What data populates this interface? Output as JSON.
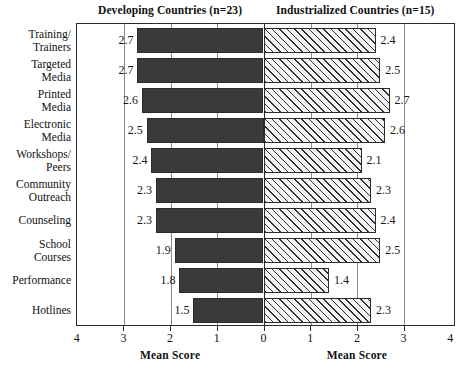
{
  "panels": {
    "left_title": "Developing Countries (n=23)",
    "right_title": "Industrialized Countries (n=15)"
  },
  "axis": {
    "left_axis_title": "Mean Score",
    "right_axis_title": "Mean Score",
    "ticks": [
      "4",
      "3",
      "2",
      "1",
      "0",
      "1",
      "2",
      "3",
      "4"
    ]
  },
  "chart_data": {
    "type": "bar",
    "orientation": "horizontal",
    "subtype": "diverging-pyramid",
    "title": "",
    "xlabel": "Mean Score",
    "ylabel": "",
    "xlim": [
      0,
      4
    ],
    "grid": true,
    "legend_position": "top",
    "categories": [
      "Training/\nTrainers",
      "Targeted\nMedia",
      "Printed\nMedia",
      "Electronic\nMedia",
      "Workshops/\nPeers",
      "Community\nOutreach",
      "Counseling",
      "School\nCourses",
      "Performance",
      "Hotlines"
    ],
    "series": [
      {
        "name": "Developing Countries (n=23)",
        "side": "left",
        "fill": "solid-dark",
        "color": "#3a3a3a",
        "values": [
          2.7,
          2.7,
          2.6,
          2.5,
          2.4,
          2.3,
          2.3,
          1.9,
          1.8,
          1.5
        ],
        "labels": [
          "2.7",
          "2.7",
          "2.6",
          "2.5",
          "2.4",
          "2.3",
          "2.3",
          "1.9",
          "1.8",
          "1.5"
        ]
      },
      {
        "name": "Industrialized Countries (n=15)",
        "side": "right",
        "fill": "diagonal-hatch",
        "color": "#f4f4f4",
        "values": [
          2.4,
          2.5,
          2.7,
          2.6,
          2.1,
          2.3,
          2.4,
          2.5,
          1.4,
          2.3
        ],
        "labels": [
          "2.4",
          "2.5",
          "2.7",
          "2.6",
          "2.1",
          "2.3",
          "2.4",
          "2.5",
          "1.4",
          "2.3"
        ]
      }
    ]
  }
}
